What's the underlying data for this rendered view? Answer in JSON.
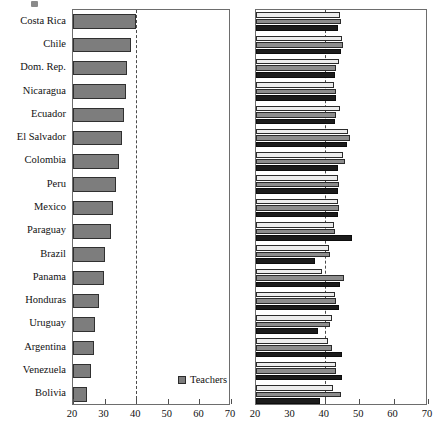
{
  "chart_data": [
    {
      "type": "bar",
      "title": "",
      "orientation": "horizontal",
      "panel": "left",
      "xlabel": "",
      "ylabel": "",
      "xlim": [
        20,
        70
      ],
      "xticks": [
        20,
        30,
        40,
        50,
        60,
        70
      ],
      "xticklabels": [
        "20",
        "30",
        "40",
        "50",
        "60",
        "70"
      ],
      "grid": false,
      "reference_line": 40,
      "legend_position": "bottom-right",
      "categories": [
        "Costa Rica",
        "Chile",
        "Dom. Rep.",
        "Nicaragua",
        "Ecuador",
        "El Salvador",
        "Colombia",
        "Peru",
        "Mexico",
        "Paraguay",
        "Brazil",
        "Panama",
        "Honduras",
        "Uruguay",
        "Argentina",
        "Venezuela",
        "Bolivia"
      ],
      "series": [
        {
          "name": "Teachers",
          "values": [
            39.8,
            38.2,
            37.0,
            36.9,
            36.2,
            35.4,
            34.6,
            33.6,
            32.5,
            32.1,
            30.1,
            29.7,
            28.2,
            27.1,
            26.7,
            25.7,
            24.5
          ]
        }
      ]
    },
    {
      "type": "bar",
      "title": "",
      "orientation": "horizontal",
      "panel": "right",
      "xlabel": "",
      "ylabel": "",
      "xlim": [
        20,
        70
      ],
      "xticks": [
        20,
        30,
        40,
        50,
        60,
        70
      ],
      "xticklabels": [
        "20",
        "30",
        "40",
        "50",
        "60",
        "70"
      ],
      "grid": false,
      "reference_line": 40,
      "legend_position": "bottom-right",
      "categories": [
        "Costa Rica",
        "Chile",
        "Dom. Rep.",
        "Nicaragua",
        "Ecuador",
        "El Salvador",
        "Colombia",
        "Peru",
        "Mexico",
        "Paraguay",
        "Brazil",
        "Panama",
        "Honduras",
        "Uruguay",
        "Argentina",
        "Venezuela",
        "Bolivia"
      ],
      "series": [
        {
          "name": "Sample 1",
          "values": [
            44.5,
            45.0,
            44.1,
            42.7,
            44.3,
            46.6,
            45.2,
            43.7,
            43.7,
            42.6,
            41.3,
            39.3,
            43.1,
            42.1,
            40.8,
            43.2,
            42.4
          ]
        },
        {
          "name": "Sample 2",
          "values": [
            44.8,
            45.4,
            43.4,
            43.4,
            43.2,
            47.2,
            45.9,
            44.1,
            44.2,
            43.0,
            41.6,
            45.5,
            43.3,
            41.5,
            42.1,
            43.2,
            44.8
          ]
        },
        {
          "name": "Sample 3",
          "values": [
            43.9,
            44.7,
            43.0,
            43.3,
            43.0,
            46.5,
            43.7,
            43.8,
            43.7,
            48.0,
            37.2,
            44.3,
            44.0,
            37.9,
            45.0,
            45.0,
            38.5
          ]
        }
      ]
    }
  ],
  "left_panel": {
    "legend": {
      "items": [
        {
          "label": "Teachers",
          "color": "#7d7d7d"
        }
      ]
    },
    "axis": {
      "ticklabels": [
        "20",
        "30",
        "40",
        "50",
        "60",
        "70"
      ]
    }
  },
  "right_panel": {
    "legend": {
      "items": [
        {
          "label": "Sample 1",
          "color": "#ececec"
        },
        {
          "label": "Sample 2",
          "color": "#8d8d8d"
        },
        {
          "label": "Sample 3",
          "color": "#1c1c1c"
        }
      ]
    },
    "axis": {
      "ticklabels": [
        "20",
        "30",
        "40",
        "50",
        "60",
        "70"
      ]
    }
  },
  "colors": {
    "teachers": "#7d7d7d",
    "sample1": "#ececec",
    "sample2": "#8d8d8d",
    "sample3": "#1c1c1c",
    "axis": "#6d6d6d",
    "refline": "#4a4a4a"
  }
}
